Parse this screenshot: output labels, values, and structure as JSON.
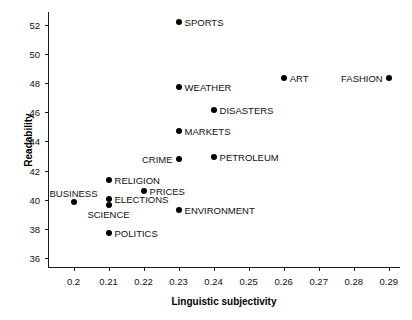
{
  "chart_data": {
    "type": "scatter",
    "title": "",
    "xlabel": "Linguistic subjectivity",
    "ylabel": "Readability",
    "xlim": [
      0.193,
      0.2935
    ],
    "ylim": [
      35.3,
      52.9
    ],
    "grid": false,
    "legend": "none",
    "xticks": [
      "0.2",
      "0.21",
      "0.22",
      "0.23",
      "0.24",
      "0.25",
      "0.26",
      "0.27",
      "0.28",
      "0.29"
    ],
    "xtick_values": [
      0.2,
      0.21,
      0.22,
      0.23,
      0.24,
      0.25,
      0.26,
      0.27,
      0.28,
      0.29
    ],
    "yticks": [
      "36",
      "38",
      "40",
      "42",
      "44",
      "46",
      "48",
      "50",
      "52"
    ],
    "ytick_values": [
      36,
      38,
      40,
      42,
      44,
      46,
      48,
      50,
      52
    ],
    "marker_color": "#000000",
    "points": [
      {
        "label": "SPORTS",
        "x": 0.23,
        "y": 52.2,
        "label_pos": "right"
      },
      {
        "label": "ART",
        "x": 0.26,
        "y": 48.35,
        "label_pos": "right"
      },
      {
        "label": "FASHION",
        "x": 0.29,
        "y": 48.35,
        "label_pos": "left"
      },
      {
        "label": "WEATHER",
        "x": 0.23,
        "y": 47.75,
        "label_pos": "right"
      },
      {
        "label": "DISASTERS",
        "x": 0.24,
        "y": 46.15,
        "label_pos": "right"
      },
      {
        "label": "MARKETS",
        "x": 0.23,
        "y": 44.7,
        "label_pos": "right"
      },
      {
        "label": "PETROLEUM",
        "x": 0.24,
        "y": 42.95,
        "label_pos": "right"
      },
      {
        "label": "CRIME",
        "x": 0.23,
        "y": 42.8,
        "label_pos": "left"
      },
      {
        "label": "RELIGION",
        "x": 0.21,
        "y": 41.35,
        "label_pos": "right"
      },
      {
        "label": "PRICES",
        "x": 0.22,
        "y": 40.6,
        "label_pos": "right"
      },
      {
        "label": "ELECTIONS",
        "x": 0.21,
        "y": 40.05,
        "label_pos": "right"
      },
      {
        "label": "BUSINESS",
        "x": 0.2,
        "y": 39.85,
        "label_pos": "above"
      },
      {
        "label": "SCIENCE",
        "x": 0.21,
        "y": 39.6,
        "label_pos": "below"
      },
      {
        "label": "ENVIRONMENT",
        "x": 0.23,
        "y": 39.3,
        "label_pos": "right"
      },
      {
        "label": "POLITICS",
        "x": 0.21,
        "y": 37.7,
        "label_pos": "right"
      }
    ]
  }
}
